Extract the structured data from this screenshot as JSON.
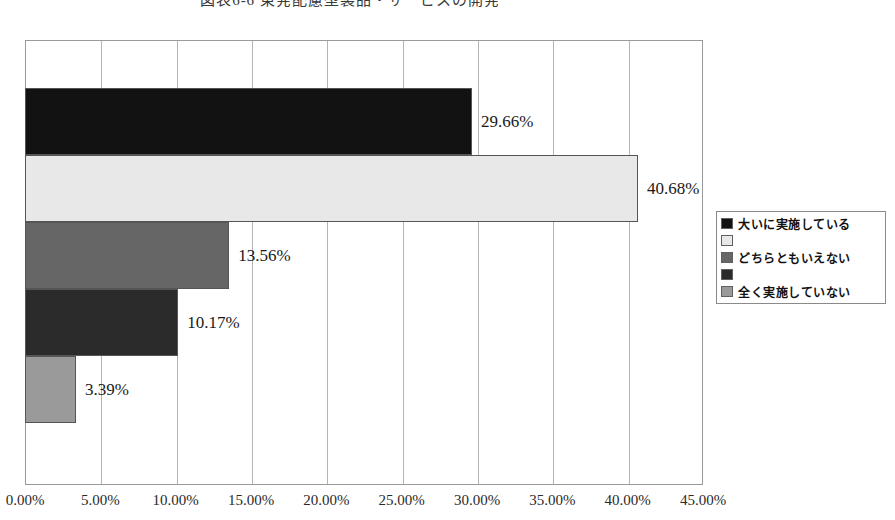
{
  "chart_data": {
    "type": "bar",
    "orientation": "horizontal",
    "title": "図表6-6 東発配慮型製品・サービスの開発",
    "categories": [
      "大いに実施している",
      "",
      "どちらともいえない",
      "",
      "全く実施していない"
    ],
    "values": [
      29.66,
      40.68,
      13.56,
      10.17,
      3.39
    ],
    "data_labels": [
      "29.66%",
      "40.68%",
      "13.56%",
      "10.17%",
      "3.39%"
    ],
    "bar_colors": [
      "#121212",
      "#e8e8e8",
      "#666666",
      "#2b2b2b",
      "#9a9a9a"
    ],
    "xlabel": "",
    "ylabel": "",
    "xlim": [
      0,
      45
    ],
    "xtick_values": [
      0,
      5,
      10,
      15,
      20,
      25,
      30,
      35,
      40,
      45
    ],
    "xtick_labels": [
      "0.00%",
      "5.00%",
      "10.00%",
      "15.00%",
      "20.00%",
      "25.00%",
      "30.00%",
      "35.00%",
      "40.00%",
      "45.00%"
    ],
    "grid": true,
    "legend_position": "right"
  },
  "legend": {
    "entries": [
      {
        "label": "大いに実施している",
        "color": "#121212"
      },
      {
        "label": "",
        "color": "#e8e8e8"
      },
      {
        "label": "どちらともいえない",
        "color": "#666666"
      },
      {
        "label": "",
        "color": "#2b2b2b"
      },
      {
        "label": "全く実施していない",
        "color": "#9a9a9a"
      }
    ]
  }
}
